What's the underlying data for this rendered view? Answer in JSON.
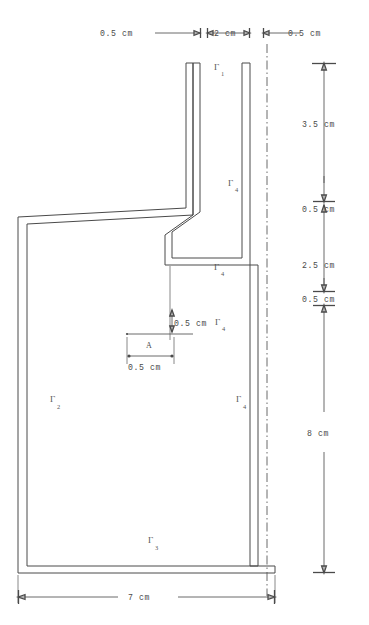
{
  "figure": {
    "units": "cm",
    "line_color": "#4a4a4a",
    "background": "#ffffff"
  },
  "dimensions": {
    "top": [
      {
        "id": "top-left-gap",
        "label": "0.5 cm",
        "value": 0.5
      },
      {
        "id": "top-channel",
        "label": "2 cm",
        "value": 2
      },
      {
        "id": "top-right-gap",
        "label": "0.5 cm",
        "value": 0.5
      }
    ],
    "right": [
      {
        "id": "right-seg-1",
        "label": "3.5 cm",
        "value": 3.5
      },
      {
        "id": "right-seg-2",
        "label": "0.5 cm",
        "value": 0.5
      },
      {
        "id": "right-seg-3",
        "label": "2.5 cm",
        "value": 2.5
      },
      {
        "id": "right-seg-4",
        "label": "0.5 cm",
        "value": 0.5
      },
      {
        "id": "right-seg-5",
        "label": "8 cm",
        "value": 8
      }
    ],
    "bottom": [
      {
        "id": "bottom-width",
        "label": "7 cm",
        "value": 7
      }
    ],
    "interior": [
      {
        "id": "ledge-thickness",
        "label": "0.5 cm",
        "value": 0.5
      },
      {
        "id": "point-a-offset",
        "label": "0.5 cm",
        "value": 0.5
      }
    ]
  },
  "boundaries": [
    {
      "id": "gamma-1",
      "symbol": "Γ",
      "subscript": "1"
    },
    {
      "id": "gamma-4-upper",
      "symbol": "Γ",
      "subscript": "4"
    },
    {
      "id": "gamma-4-ledge",
      "symbol": "Γ",
      "subscript": "4"
    },
    {
      "id": "gamma-4-mid",
      "symbol": "Γ",
      "subscript": "4"
    },
    {
      "id": "gamma-4-lower",
      "symbol": "Γ",
      "subscript": "4"
    },
    {
      "id": "gamma-2",
      "symbol": "Γ",
      "subscript": "2"
    },
    {
      "id": "gamma-3",
      "symbol": "Γ",
      "subscript": "3"
    }
  ],
  "points": [
    {
      "id": "point-a",
      "label": "A"
    }
  ]
}
